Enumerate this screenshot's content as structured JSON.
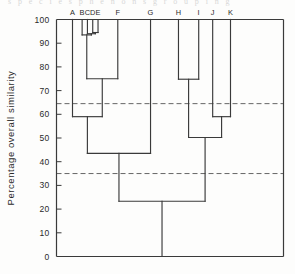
{
  "page": {
    "bleed_text_above": "s p e c i e s    p h e n o n s    g r o u p i n g"
  },
  "chart_data": {
    "type": "dendrogram",
    "title": "",
    "xlabel": "",
    "ylabel": "Percentage  overall  similarity",
    "ylim": [
      0,
      100
    ],
    "y_ticks": [
      0,
      10,
      20,
      30,
      40,
      50,
      60,
      70,
      80,
      90,
      100
    ],
    "y_tick_labels": [
      "0",
      "10",
      "20",
      "30",
      "40",
      "50",
      "60",
      "70",
      "80",
      "90",
      "100"
    ],
    "grid": false,
    "leaf_labels": [
      "A",
      "B",
      "C",
      "D",
      "E",
      "F",
      "G",
      "H",
      "I",
      "J",
      "K"
    ],
    "leaf_positions": [
      0.0,
      1.0,
      1.55,
      2.1,
      2.65,
      4.7,
      8.1,
      11.0,
      13.1,
      14.55,
      16.4
    ],
    "leaf_top_value": 100,
    "merges": [
      {
        "name": "m1",
        "members": [
          "D",
          "E"
        ],
        "height": 94.5
      },
      {
        "name": "m2",
        "members": [
          "C",
          "m1"
        ],
        "height": 94.0
      },
      {
        "name": "m3",
        "members": [
          "B",
          "m2"
        ],
        "height": 93.5
      },
      {
        "name": "m4",
        "members": [
          "m3",
          "F"
        ],
        "height": 75.0
      },
      {
        "name": "m5",
        "members": [
          "A",
          "m4"
        ],
        "height": 59.0
      },
      {
        "name": "m6",
        "members": [
          "m5",
          "G"
        ],
        "height": 43.5
      },
      {
        "name": "m7",
        "members": [
          "H",
          "I"
        ],
        "height": 74.8
      },
      {
        "name": "m8",
        "members": [
          "J",
          "K"
        ],
        "height": 59.0
      },
      {
        "name": "m9",
        "members": [
          "m7",
          "m8"
        ],
        "height": 50.2
      },
      {
        "name": "m10",
        "members": [
          "m6",
          "m9"
        ],
        "height": 23.3
      }
    ],
    "root_stem_bottom": 0,
    "threshold_lines": [
      {
        "value": 64.5,
        "style": "dashed"
      },
      {
        "value": 35.0,
        "style": "dashed"
      }
    ],
    "colors": {
      "line": "#3a3a3a",
      "axis": "#3a3a3a",
      "threshold": "#555555",
      "background": "#fdfdfc"
    }
  }
}
